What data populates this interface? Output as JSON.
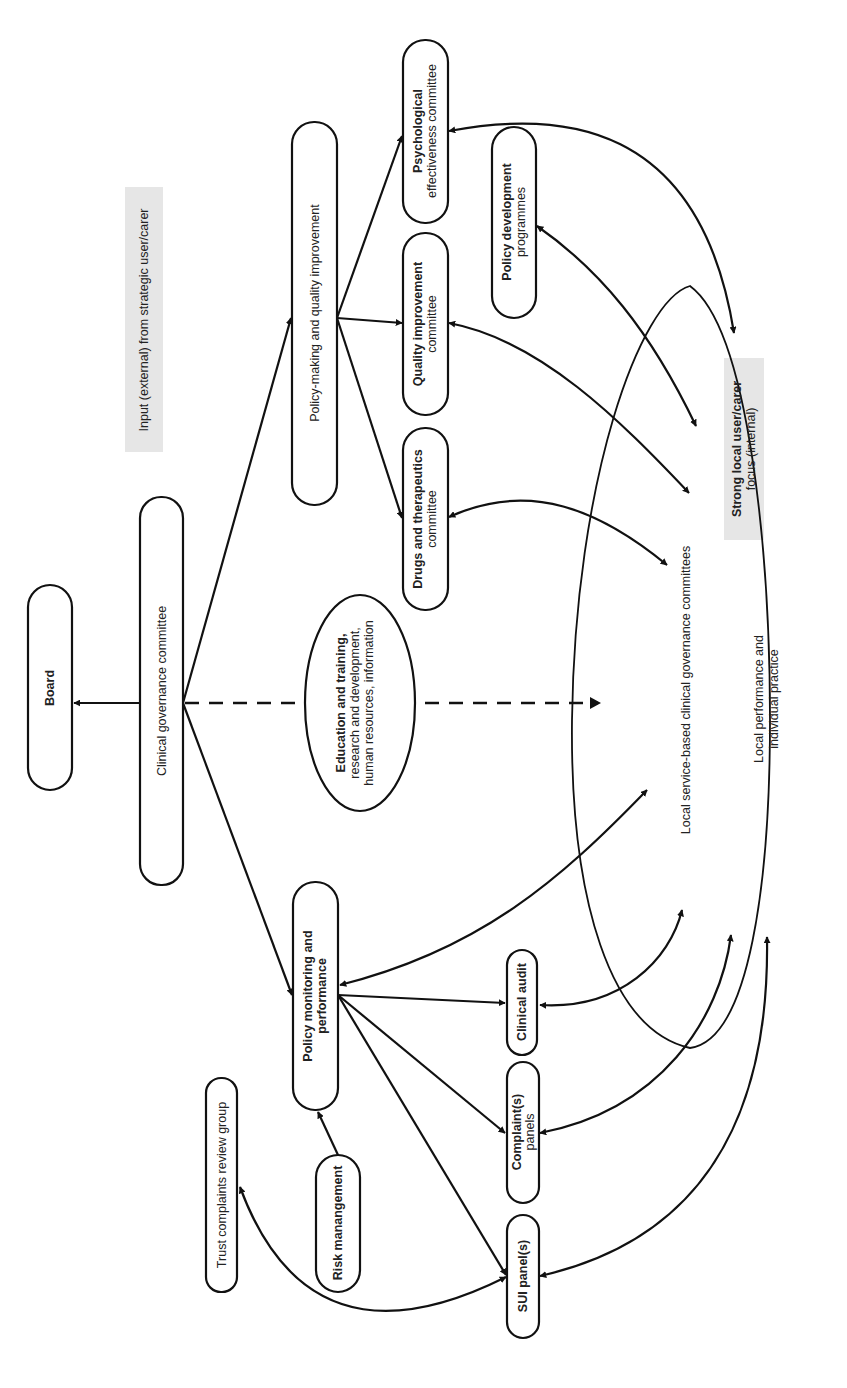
{
  "diagram": {
    "orientation": "rotated-90-ccw",
    "colors": {
      "stroke": "#111111",
      "text": "#222222",
      "highlight_bg": "#e6e6e6",
      "background": "#ffffff"
    },
    "nodes": {
      "board": {
        "label": "Board"
      },
      "clinical_governance": {
        "label": "Clinical governance committee"
      },
      "policy_making": {
        "label": "Policy-making and quality improvement"
      },
      "policy_monitoring": {
        "line1": "Policy monitoring and",
        "line2": "performance"
      },
      "education": {
        "line1": "Education and training,",
        "line2": "research and development,",
        "line3": "human resources, information"
      },
      "drugs": {
        "line1": "Drugs and therapeutics",
        "line2": "committee"
      },
      "quality": {
        "line1": "Quality improvement",
        "line2": "committee"
      },
      "psychological": {
        "line1": "Psychological",
        "line2": "effectiveness committee"
      },
      "policy_development": {
        "line1": "Policy development",
        "line2": "programmes"
      },
      "clinical_audit": {
        "label": "Clinical audit"
      },
      "complaints_panels": {
        "line1": "Complaint(s)",
        "line2": "panels"
      },
      "sui_panels": {
        "label": "SUI panel(s)"
      },
      "risk_management": {
        "label": "Risk manangement"
      },
      "trust_complaints": {
        "label": "Trust complaints review group"
      }
    },
    "annotations": {
      "input_external": {
        "label": "Input (external) from strategic user/carer"
      },
      "strong_local": {
        "line1": "Strong local user/carer",
        "line2": "focus (internal)"
      },
      "local_service": {
        "label": "Local service-based clinical governance committees"
      },
      "local_performance": {
        "line1": "Local performance and",
        "line2": "individual practice"
      }
    },
    "edges": [
      {
        "from": "Clinical governance committee",
        "to": "Board",
        "style": "solid"
      },
      {
        "from": "Clinical governance committee",
        "to": "Policy-making and quality improvement",
        "style": "solid"
      },
      {
        "from": "Clinical governance committee",
        "to": "Policy monitoring and performance",
        "style": "solid"
      },
      {
        "from": "Clinical governance committee",
        "to": "Local service-based clinical governance committees",
        "style": "dashed",
        "via": "Education and training, research and development, human resources, information"
      },
      {
        "from": "Policy-making and quality improvement",
        "to": "Drugs and therapeutics committee",
        "style": "solid"
      },
      {
        "from": "Policy-making and quality improvement",
        "to": "Quality improvement committee",
        "style": "solid"
      },
      {
        "from": "Policy-making and quality improvement",
        "to": "Psychological effectiveness committee",
        "style": "solid"
      },
      {
        "from": "Policy monitoring and performance",
        "to": "Clinical audit",
        "style": "solid"
      },
      {
        "from": "Policy monitoring and performance",
        "to": "Complaint(s) panels",
        "style": "solid"
      },
      {
        "from": "Policy monitoring and performance",
        "to": "SUI panel(s)",
        "style": "solid"
      },
      {
        "from": "Policy monitoring and performance",
        "to": "Local service-based clinical governance committees",
        "style": "curved-bidirectional"
      },
      {
        "from": "Risk manangement",
        "to": "Policy monitoring and performance",
        "style": "solid"
      },
      {
        "from": "SUI panel(s)",
        "to": "Trust complaints review group",
        "style": "curved-bidirectional"
      },
      {
        "from": "Drugs and therapeutics committee",
        "to": "Local service-based clinical governance committees",
        "style": "curved-bidirectional"
      },
      {
        "from": "Quality improvement committee",
        "to": "Local service-based clinical governance committees",
        "style": "curved-bidirectional"
      },
      {
        "from": "Policy development programmes",
        "to": "Local service-based clinical governance committees",
        "style": "curved-bidirectional"
      },
      {
        "from": "Psychological effectiveness committee",
        "to": "Strong local user/carer focus (internal)",
        "style": "curved-bidirectional"
      },
      {
        "from": "Clinical audit",
        "to": "Local service-based clinical governance committees",
        "style": "curved-bidirectional"
      },
      {
        "from": "Complaint(s) panels",
        "to": "Local performance and individual practice",
        "style": "curved-bidirectional"
      },
      {
        "from": "SUI panel(s)",
        "to": "Local performance and individual practice",
        "style": "curved-bidirectional"
      }
    ]
  }
}
